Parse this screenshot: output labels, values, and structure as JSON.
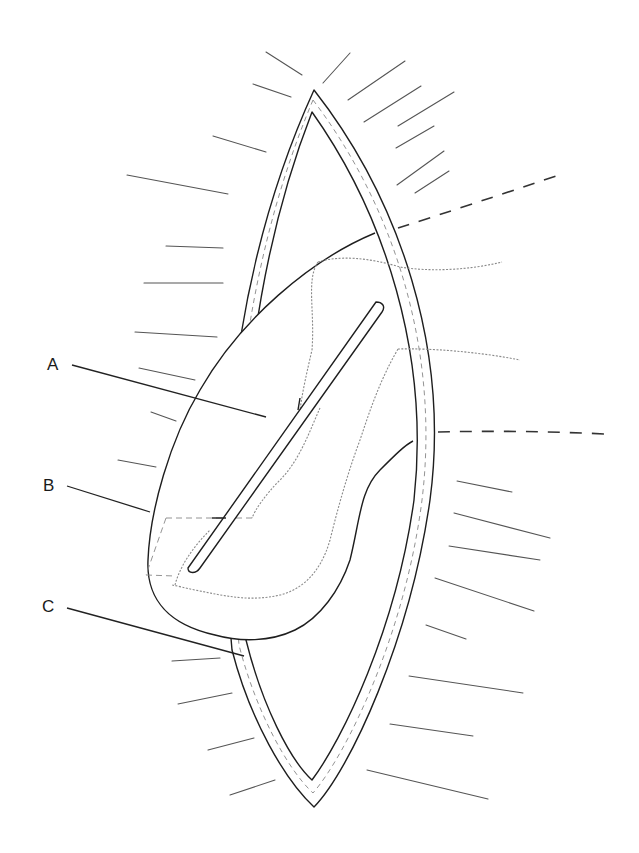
{
  "figure": {
    "labels": [
      {
        "id": "A",
        "text": "A"
      },
      {
        "id": "B",
        "text": "B"
      },
      {
        "id": "C",
        "text": "C"
      }
    ],
    "colors": {
      "background": "#ffffff",
      "ink": "#1e1e1e",
      "rays": "#555555",
      "suture": "#8a8a8a"
    }
  }
}
